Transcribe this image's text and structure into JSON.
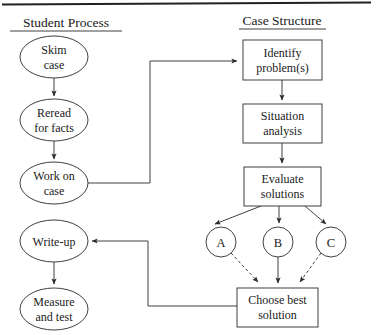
{
  "figure": {
    "top_rule": true,
    "headings": [
      {
        "id": "student-process",
        "label": "Student Process",
        "x": 66,
        "y": 27
      },
      {
        "id": "case-structure",
        "label": "Case Structure",
        "x": 282,
        "y": 25
      }
    ]
  },
  "student_process": {
    "heading": "Student Process",
    "nodes": [
      {
        "id": "skim-case",
        "shape": "oval",
        "lines": [
          "Skim",
          "case"
        ],
        "cx": 54,
        "cy": 57,
        "rx": 34,
        "ry": 21
      },
      {
        "id": "reread-for-facts",
        "shape": "oval",
        "lines": [
          "Reread",
          "for facts"
        ],
        "cx": 54,
        "cy": 120,
        "rx": 34,
        "ry": 21
      },
      {
        "id": "work-on-case",
        "shape": "oval",
        "lines": [
          "Work on",
          "case"
        ],
        "cx": 54,
        "cy": 183,
        "rx": 34,
        "ry": 21
      },
      {
        "id": "write-up",
        "shape": "oval",
        "lines": [
          "Write-up"
        ],
        "cx": 54,
        "cy": 241,
        "rx": 34,
        "ry": 21
      },
      {
        "id": "measure-and-test",
        "shape": "oval",
        "lines": [
          "Measure",
          "and test"
        ],
        "cx": 54,
        "cy": 309,
        "rx": 34,
        "ry": 21
      }
    ]
  },
  "case_structure": {
    "heading": "Case Structure",
    "nodes": [
      {
        "id": "identify-problems",
        "shape": "box",
        "lines": [
          "Identify",
          "problem(s)"
        ],
        "x": 243,
        "y": 40,
        "w": 79,
        "h": 40
      },
      {
        "id": "situation-analysis",
        "shape": "box",
        "lines": [
          "Situation",
          "analysis"
        ],
        "x": 243,
        "y": 104,
        "w": 79,
        "h": 39
      },
      {
        "id": "evaluate-solutions",
        "shape": "box",
        "lines": [
          "Evaluate",
          "solutions"
        ],
        "x": 244,
        "y": 167,
        "w": 77,
        "h": 39
      },
      {
        "id": "option-a",
        "shape": "circle",
        "lines": [
          "A"
        ],
        "cx": 221,
        "cy": 242,
        "r": 15
      },
      {
        "id": "option-b",
        "shape": "circle",
        "lines": [
          "B"
        ],
        "cx": 278,
        "cy": 242,
        "r": 15
      },
      {
        "id": "option-c",
        "shape": "circle",
        "lines": [
          "C"
        ],
        "cx": 331,
        "cy": 242,
        "r": 15
      },
      {
        "id": "choose-best-solution",
        "shape": "box",
        "lines": [
          "Choose best",
          "solution"
        ],
        "x": 237,
        "y": 288,
        "w": 81,
        "h": 39
      }
    ]
  },
  "edges": [
    {
      "id": "skim-to-reread",
      "from": "skim-case",
      "to": "reread-for-facts",
      "style": "solid",
      "arrow": true
    },
    {
      "id": "reread-to-work",
      "from": "reread-for-facts",
      "to": "work-on-case",
      "style": "solid",
      "arrow": true
    },
    {
      "id": "work-to-identify",
      "from": "work-on-case",
      "to": "identify-problems",
      "style": "solid",
      "arrow": true
    },
    {
      "id": "identify-to-situation",
      "from": "identify-problems",
      "to": "situation-analysis",
      "style": "solid",
      "arrow": true
    },
    {
      "id": "situation-to-evaluate",
      "from": "situation-analysis",
      "to": "evaluate-solutions",
      "style": "solid",
      "arrow": true
    },
    {
      "id": "evaluate-to-a",
      "from": "evaluate-solutions",
      "to": "option-a",
      "style": "solid",
      "arrow": true
    },
    {
      "id": "evaluate-to-b",
      "from": "evaluate-solutions",
      "to": "option-b",
      "style": "solid",
      "arrow": true
    },
    {
      "id": "evaluate-to-c",
      "from": "evaluate-solutions",
      "to": "option-c",
      "style": "solid",
      "arrow": true
    },
    {
      "id": "a-to-choose",
      "from": "option-a",
      "to": "choose-best-solution",
      "style": "dashed",
      "arrow": true
    },
    {
      "id": "b-to-choose",
      "from": "option-b",
      "to": "choose-best-solution",
      "style": "solid",
      "arrow": true
    },
    {
      "id": "c-to-choose",
      "from": "option-c",
      "to": "choose-best-solution",
      "style": "dashed",
      "arrow": true
    },
    {
      "id": "choose-to-write-up",
      "from": "choose-best-solution",
      "to": "write-up",
      "style": "solid",
      "arrow": true
    },
    {
      "id": "write-up-to-measure",
      "from": "write-up",
      "to": "measure-and-test",
      "style": "solid",
      "arrow": true
    }
  ]
}
